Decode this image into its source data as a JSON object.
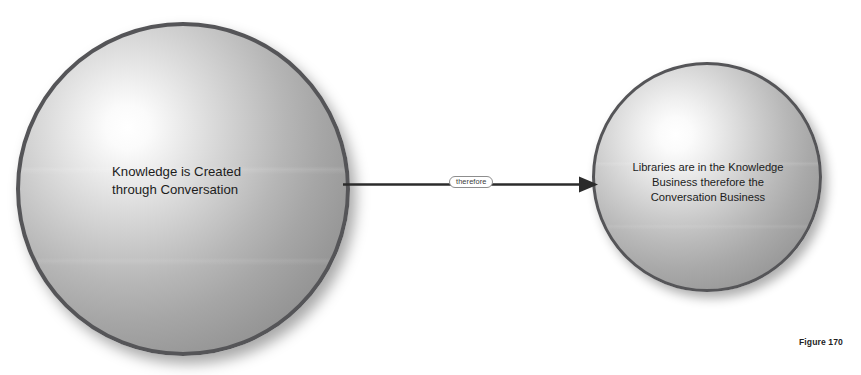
{
  "figure": {
    "caption": "Figure 170",
    "background_color": "#ffffff"
  },
  "nodes": [
    {
      "id": "knowledge-sphere",
      "shape": "sphere",
      "text": "Knowledge is Created\nthrough Conversation",
      "text_align": "left",
      "border_color": "#555558",
      "fill_light": "#ffffff",
      "fill_dark": "#848486"
    },
    {
      "id": "libraries-sphere",
      "shape": "sphere",
      "text": "Libraries are in the Knowledge\nBusiness therefore the\nConversation Business",
      "text_align": "center",
      "border_color": "#555558",
      "fill_light": "#ffffff",
      "fill_dark": "#87878a"
    }
  ],
  "connector": {
    "label": "therefore",
    "from": "knowledge-sphere",
    "to": "libraries-sphere",
    "style": "solid-arrow",
    "color": "#2b2b2b"
  }
}
